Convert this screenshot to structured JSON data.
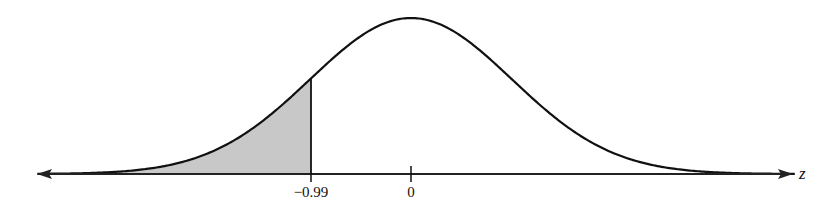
{
  "chart_data": {
    "type": "area",
    "title": "",
    "xlabel": "z",
    "ylabel": "",
    "distribution": "standard normal",
    "xlim": [
      -3.7,
      3.8
    ],
    "tick_labels": [
      "-0.99",
      "0"
    ],
    "ticks": [
      -0.99,
      0
    ],
    "shaded_region": {
      "from": "-inf",
      "to": -0.99,
      "color": "#c8c8c8"
    },
    "curve_color": "#111111",
    "grid": false,
    "legend": null
  },
  "labels": {
    "tick_neg": "−0.99",
    "tick_zero": "0",
    "axis_var": "z"
  }
}
